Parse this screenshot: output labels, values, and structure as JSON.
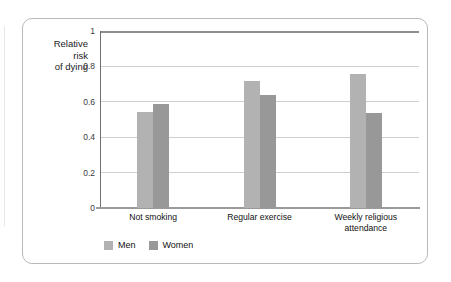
{
  "chart_data": {
    "type": "bar",
    "title": "",
    "xlabel": "",
    "ylabel": "Relative\nrisk\nof dying",
    "ylim": [
      0,
      1
    ],
    "yticks": [
      "0",
      "0.2",
      "0.4",
      "0.6",
      "0.8",
      "1"
    ],
    "grid": true,
    "legend_position": "bottom-left",
    "categories": [
      "Not smoking",
      "Regular exercise",
      "Weekly religious\nattendance"
    ],
    "series": [
      {
        "name": "Men",
        "color": "#b2b2b2",
        "values": [
          0.54,
          0.72,
          0.755
        ]
      },
      {
        "name": "Women",
        "color": "#989898",
        "values": [
          0.585,
          0.64,
          0.535
        ]
      }
    ]
  },
  "legend": {
    "items": [
      {
        "label": "Men",
        "color": "#b2b2b2"
      },
      {
        "label": "Women",
        "color": "#989898"
      }
    ]
  }
}
